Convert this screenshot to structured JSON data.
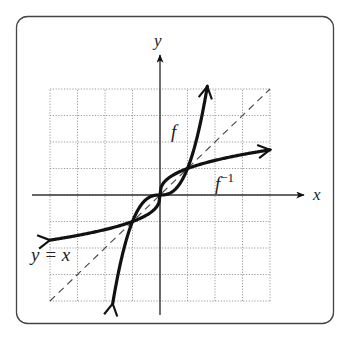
{
  "diagram": {
    "type": "function-and-inverse-graph",
    "frame": {
      "left": 16,
      "top": 16,
      "right": 334,
      "bottom": 324,
      "radius": 11,
      "stroke": "#444444"
    },
    "grid": {
      "x_min": -4,
      "x_max": 4,
      "y_min": -4,
      "y_max": 4,
      "step": 1,
      "style": "dotted",
      "color": "#9a9a9a"
    },
    "axes": {
      "x_label": "x",
      "y_label": "y",
      "color": "#333333"
    },
    "curves": [
      {
        "name": "f",
        "label": "f",
        "description": "steep increasing odd function, crosses y=x at (-1,-1),(0,0),(1,1)",
        "exponent": 2.6
      },
      {
        "name": "f_inverse",
        "label": "f",
        "label_sup": "−1",
        "description": "reflection of f across y=x",
        "exponent": 0.3846
      }
    ],
    "reference_line": {
      "label": "y = x",
      "style": "dashed"
    },
    "intersections": [
      [
        -1,
        -1
      ],
      [
        0,
        0
      ],
      [
        1,
        1
      ]
    ],
    "colors": {
      "curve": "#111111",
      "dashed": "#444444",
      "background": "#ffffff"
    }
  }
}
